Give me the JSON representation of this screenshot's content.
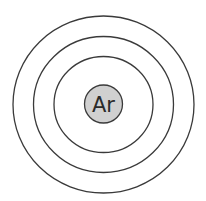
{
  "diagram": {
    "type": "bohr-model",
    "element_symbol": "Ar",
    "shell_count": 3,
    "colors": {
      "stroke": "#3a3a3a",
      "nucleus_fill": "#d0d0d0",
      "background": "#ffffff"
    }
  }
}
